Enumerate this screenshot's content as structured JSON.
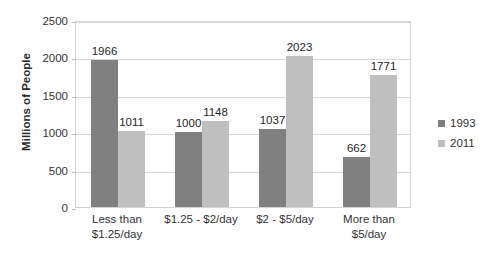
{
  "chart_data": {
    "type": "bar",
    "title": "",
    "subtitle": "",
    "xlabel": "",
    "ylabel": "Millions of People",
    "categories": [
      "Less than $1.25/day",
      "$1.25 - $2/day",
      "$2 - $5/day",
      "More than $5/day"
    ],
    "category_lines": [
      [
        "Less than",
        "$1.25/day"
      ],
      [
        "$1.25 - $2/day",
        ""
      ],
      [
        "$2 - $5/day",
        ""
      ],
      [
        "More than",
        "$5/day"
      ]
    ],
    "series": [
      {
        "name": "1993",
        "values": [
          1966,
          1000,
          1037,
          662
        ],
        "color": "#808080"
      },
      {
        "name": "2011",
        "values": [
          1011,
          1148,
          2023,
          1771
        ],
        "color": "#bfbfbf"
      }
    ],
    "ylim": [
      0,
      2500
    ],
    "ytick_values": [
      0,
      500,
      1000,
      1500,
      2000,
      2500
    ],
    "ytick_labels": [
      "0",
      "500",
      "1000",
      "1500",
      "2000",
      "2500"
    ],
    "grid": true,
    "grid_axis": "y",
    "legend_position": "right",
    "data_labels": true,
    "data_label_values": [
      [
        "1966",
        "1011"
      ],
      [
        "1000",
        "1148"
      ],
      [
        "1037",
        "2023"
      ],
      [
        "662",
        "1771"
      ]
    ]
  },
  "legend": {
    "items": [
      {
        "label": "1993",
        "color": "#808080"
      },
      {
        "label": "2011",
        "color": "#bfbfbf"
      }
    ]
  },
  "colors": {
    "series_1993": "#808080",
    "series_2011": "#bfbfbf",
    "gridline": "#d9d9d9",
    "plot_border": "#d4d4d4",
    "text": "#333333"
  }
}
